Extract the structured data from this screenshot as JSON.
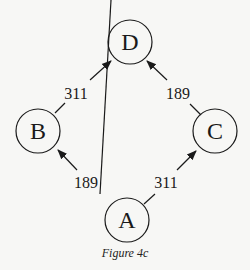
{
  "figure": {
    "caption": "Figure 4c",
    "nodes": [
      {
        "id": "D",
        "label": "D"
      },
      {
        "id": "B",
        "label": "B"
      },
      {
        "id": "C",
        "label": "C"
      },
      {
        "id": "A",
        "label": "A"
      }
    ],
    "edges": [
      {
        "from": "A",
        "to": "B",
        "weight": "189"
      },
      {
        "from": "A",
        "to": "C",
        "weight": "311"
      },
      {
        "from": "B",
        "to": "D",
        "weight": "311"
      },
      {
        "from": "C",
        "to": "D",
        "weight": "189"
      }
    ]
  }
}
